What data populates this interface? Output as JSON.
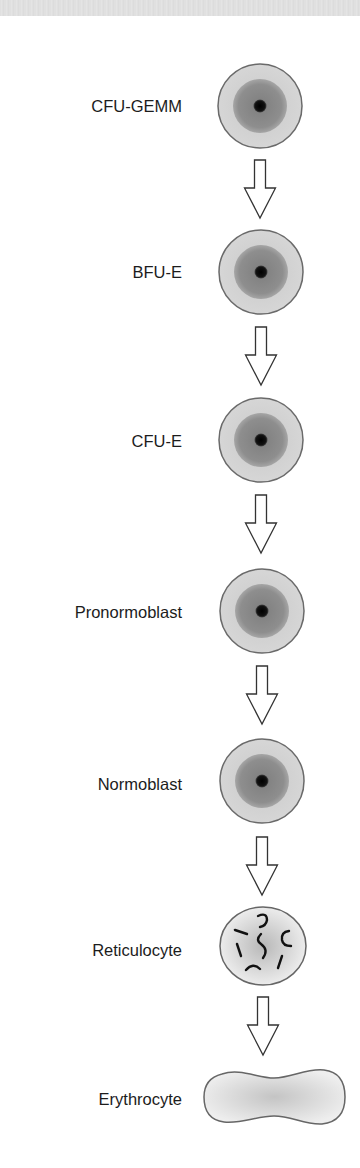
{
  "diagram": {
    "type": "vertical-lineage-flow",
    "colors": {
      "cell_outline": "#666666",
      "outer_cytoplasm": "#cfcfcf",
      "inner_cytoplasm": "#8c8c8c",
      "nucleus": "#0a0a0a",
      "arrow_stroke": "#333333",
      "label_text": "#1c1c1c",
      "top_band": "#e0e0e0"
    },
    "stages": [
      {
        "label": "CFU-GEMM",
        "icon": "progenitor-cell-icon"
      },
      {
        "label": "BFU-E",
        "icon": "progenitor-cell-icon"
      },
      {
        "label": "CFU-E",
        "icon": "progenitor-cell-icon"
      },
      {
        "label": "Pronormoblast",
        "icon": "progenitor-cell-icon"
      },
      {
        "label": "Normoblast",
        "icon": "progenitor-cell-icon"
      },
      {
        "label": "Reticulocyte",
        "icon": "reticulocyte-cell-icon"
      },
      {
        "label": "Erythrocyte",
        "icon": "erythrocyte-cell-icon"
      }
    ],
    "arrows": [
      {
        "from": "CFU-GEMM",
        "to": "BFU-E"
      },
      {
        "from": "BFU-E",
        "to": "CFU-E"
      },
      {
        "from": "CFU-E",
        "to": "Pronormoblast"
      },
      {
        "from": "Pronormoblast",
        "to": "Normoblast"
      },
      {
        "from": "Normoblast",
        "to": "Reticulocyte"
      },
      {
        "from": "Reticulocyte",
        "to": "Erythrocyte"
      }
    ]
  }
}
